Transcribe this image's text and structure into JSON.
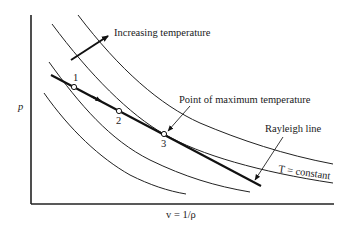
{
  "diagram": {
    "axes": {
      "y_label": "p",
      "x_label": "v = 1/ρ"
    },
    "annotations": {
      "increasing_temperature": "Increasing temperature",
      "max_temperature": "Point of maximum temperature",
      "rayleigh_line": "Rayleigh line",
      "isotherm": "T = constant"
    },
    "points": [
      {
        "id": "1",
        "label": "1"
      },
      {
        "id": "2",
        "label": "2"
      },
      {
        "id": "3",
        "label": "3"
      }
    ],
    "colors": {
      "line": "#222222",
      "background": "#ffffff"
    }
  }
}
